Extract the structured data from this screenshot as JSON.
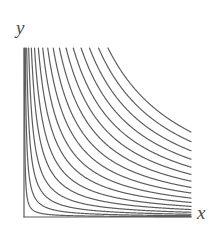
{
  "figure": {
    "kind": "contour-plot",
    "background_color": "#ffffff",
    "curve_color": "#5d5d5d",
    "axis_color": "#5d5d5d",
    "label_color": "#4a4a4a",
    "curve_stroke_width": 1.2,
    "axis_stroke_width": 1.2
  },
  "axes": {
    "x_label": "x",
    "y_label": "y",
    "origin": {
      "x": 24,
      "y": 217
    },
    "x_axis": {
      "x1": 24,
      "y1": 217,
      "x2": 191,
      "y2": 217
    },
    "y_axis": {
      "x1": 24,
      "y1": 48,
      "x2": 24,
      "y2": 217
    },
    "x_label_pos": {
      "x": 197,
      "y": 203
    },
    "y_label_pos": {
      "x": 16,
      "y": 18
    }
  },
  "chart_data": {
    "type": "line",
    "title": "",
    "subtitle": "",
    "xlabel": "x",
    "ylabel": "y",
    "grid": false,
    "legend": "none",
    "xlim": [
      0,
      1
    ],
    "ylim": [
      0,
      1
    ],
    "plot_box": {
      "left": 24,
      "top": 48,
      "right": 191,
      "bottom": 217
    },
    "family": "xy = c",
    "note": "Hyperbolic level curves in the first quadrant; the lowest curve is nearly a straight ray from the origin and successive curves bow away from the origin toward the upper right.",
    "n_curves": 17,
    "c_values": [
      0.0022,
      0.0075,
      0.016,
      0.028,
      0.044,
      0.063,
      0.086,
      0.112,
      0.142,
      0.175,
      0.212,
      0.252,
      0.295,
      0.342,
      0.392,
      0.446,
      0.503
    ],
    "series": [
      {
        "name": "xy = 0.0022",
        "c": 0.0022
      },
      {
        "name": "xy = 0.0075",
        "c": 0.0075
      },
      {
        "name": "xy = 0.016",
        "c": 0.016
      },
      {
        "name": "xy = 0.028",
        "c": 0.028
      },
      {
        "name": "xy = 0.044",
        "c": 0.044
      },
      {
        "name": "xy = 0.063",
        "c": 0.063
      },
      {
        "name": "xy = 0.086",
        "c": 0.086
      },
      {
        "name": "xy = 0.112",
        "c": 0.112
      },
      {
        "name": "xy = 0.142",
        "c": 0.142
      },
      {
        "name": "xy = 0.175",
        "c": 0.175
      },
      {
        "name": "xy = 0.212",
        "c": 0.212
      },
      {
        "name": "xy = 0.252",
        "c": 0.252
      },
      {
        "name": "xy = 0.295",
        "c": 0.295
      },
      {
        "name": "xy = 0.342",
        "c": 0.342
      },
      {
        "name": "xy = 0.392",
        "c": 0.392
      },
      {
        "name": "xy = 0.446",
        "c": 0.446
      },
      {
        "name": "xy = 0.503",
        "c": 0.503
      }
    ]
  }
}
